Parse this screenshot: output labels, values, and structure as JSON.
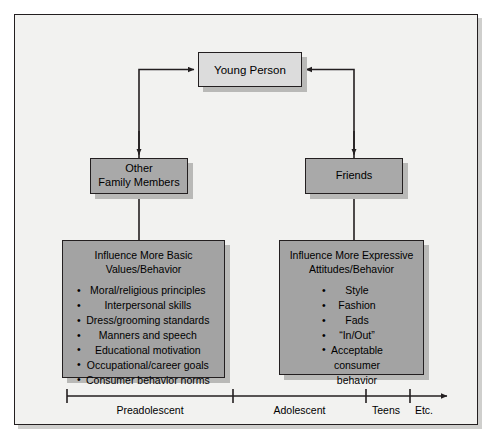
{
  "diagram": {
    "top_node": {
      "label": "Young Person"
    },
    "mid_nodes": [
      {
        "id": "other-family",
        "line1": "Other",
        "line2": "Family Members"
      },
      {
        "id": "friends",
        "line1": "Friends",
        "line2": ""
      }
    ],
    "content_boxes": [
      {
        "id": "left-box",
        "heading_line1": "Influence More Basic",
        "heading_line2": "Values/Behavior",
        "items": [
          "Moral/religious principles",
          "Interpersonal skills",
          "Dress/grooming standards",
          "Manners and speech",
          "Educational motivation",
          "Occupational/career goals",
          "Consumer behavior norms"
        ]
      },
      {
        "id": "right-box",
        "heading_line1": "Influence More Expressive",
        "heading_line2": "Attitudes/Behavior",
        "items": [
          "Style",
          "Fashion",
          "Fads",
          "“In/Out”",
          "Acceptable"
        ],
        "item_continuations": [
          "consumer",
          "behavior"
        ]
      }
    ],
    "timeline": {
      "segments": [
        {
          "label": "Preadolescent"
        },
        {
          "label": "Adolescent"
        },
        {
          "label": "Teens"
        },
        {
          "label": "Etc."
        }
      ]
    },
    "colors": {
      "frame_background": "#f2f2f0",
      "top_node_fill": "#dcdcdc",
      "mid_node_fill": "#a9a9a9",
      "content_box_fill": "#a3a3a3",
      "stroke": "#231f20",
      "shadow": "#b9b9b7"
    }
  }
}
